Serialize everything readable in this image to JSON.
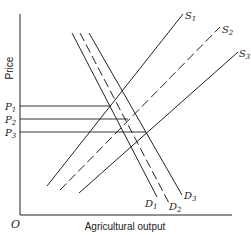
{
  "diagram": {
    "y_axis_label": "Price",
    "x_axis_label": "Agricultural output",
    "origin_label": "O",
    "price_levels": [
      {
        "label": "P",
        "sub": "1",
        "y": 106,
        "x_end": 110
      },
      {
        "label": "P",
        "sub": "2",
        "y": 119,
        "x_end": 128
      },
      {
        "label": "P",
        "sub": "3",
        "y": 132,
        "x_end": 146
      }
    ],
    "supply_curves": [
      {
        "label": "S",
        "sub": "1",
        "style": "solid",
        "from": [
          47,
          186
        ],
        "to": [
          183,
          14
        ]
      },
      {
        "label": "S",
        "sub": "2",
        "style": "dashed",
        "from": [
          60,
          190
        ],
        "to": [
          220,
          27
        ]
      },
      {
        "label": "S",
        "sub": "3",
        "style": "solid",
        "from": [
          79,
          193
        ],
        "to": [
          238,
          52
        ]
      }
    ],
    "demand_curves": [
      {
        "label": "D",
        "sub": "1",
        "style": "solid",
        "from": [
          72,
          33
        ],
        "to": [
          157,
          197
        ]
      },
      {
        "label": "D",
        "sub": "2",
        "style": "dashed",
        "from": [
          80,
          33
        ],
        "to": [
          170,
          205
        ]
      },
      {
        "label": "D",
        "sub": "3",
        "style": "solid",
        "from": [
          89,
          33
        ],
        "to": [
          182,
          195
        ]
      }
    ],
    "line_color": "#222222"
  }
}
